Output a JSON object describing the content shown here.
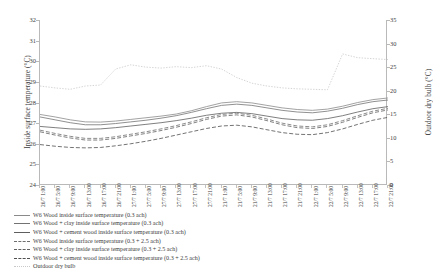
{
  "chart_data": {
    "type": "line",
    "title": "",
    "xlabel": "",
    "ylabel": "Inside surface temperature (°C)",
    "y2label": "Outdoor dry bulb (°C)",
    "ylim": [
      24,
      32
    ],
    "yticks": [
      "24",
      "25",
      "26",
      "27",
      "28",
      "29",
      "30",
      "31",
      "32"
    ],
    "y2lim": [
      0,
      35
    ],
    "y2ticks": [
      "0",
      "5",
      "10",
      "15",
      "20",
      "25",
      "30",
      "35"
    ],
    "grid": false,
    "legend_position": "below",
    "x": [
      "26/7 1:00",
      "26/7 5:00",
      "26/7 9:00",
      "26/7 13:00",
      "26/7 17:00",
      "26/7 21:00",
      "27/7 1:00",
      "27/7 5:00",
      "27/7 9:00",
      "27/7 13:00",
      "27/7 17:00",
      "27/7 21:00",
      "21/7 1:00",
      "21/7 5:00",
      "21/7 9:00",
      "21/7 13:00",
      "21/7 17:00",
      "21/7 21:00",
      "22/7 1:00",
      "22/7 5:00",
      "22/7 9:00",
      "22/7 13:00",
      "22/7 17:00",
      "22/7 21:00"
    ],
    "xtick_labels": [
      "26/7 1:00",
      "26/7 5:00",
      "26/7 9:00",
      "26/7 13:00",
      "26/7 17:00",
      "26/7 21:00",
      "27/7 1:00",
      "27/7 5:00",
      "27/7 9:00",
      "27/7 13:00",
      "27/7 17:00",
      "27/7 21:00",
      "21/7 1:00",
      "21/7 5:00",
      "21/7 9:00",
      "21/7 13:00",
      "21/7 17:00",
      "21/7 21:00",
      "22/7 1:00",
      "22/7 5:00",
      "22/7 9:00",
      "22/7 13:00",
      "22/7 17:00",
      "22/7 21:00"
    ],
    "series": [
      {
        "name": "W6 Wood inside surface temperature (0.3 ach)",
        "axis": "left",
        "style": "solid",
        "color": "#8a8a8a",
        "values": [
          27.42,
          27.3,
          27.16,
          27.06,
          27.05,
          27.1,
          27.18,
          27.26,
          27.34,
          27.44,
          27.6,
          27.8,
          27.98,
          28.04,
          27.98,
          27.86,
          27.74,
          27.66,
          27.62,
          27.68,
          27.82,
          28.0,
          28.14,
          28.22
        ]
      },
      {
        "name": "W6 Wood + clay inside surface temperature (0.3 ach)",
        "axis": "left",
        "style": "solid",
        "color": "#737373",
        "values": [
          27.3,
          27.16,
          27.02,
          26.92,
          26.92,
          26.98,
          27.06,
          27.14,
          27.24,
          27.36,
          27.52,
          27.7,
          27.86,
          27.92,
          27.86,
          27.74,
          27.62,
          27.54,
          27.5,
          27.58,
          27.72,
          27.9,
          28.04,
          28.12
        ]
      },
      {
        "name": "W6 Wood + cement wood inside surface temperature (0.3 ach)",
        "axis": "left",
        "style": "solid",
        "color": "#5e5e5e",
        "values": [
          26.84,
          26.78,
          26.72,
          26.7,
          26.72,
          26.78,
          26.86,
          26.94,
          27.02,
          27.12,
          27.24,
          27.38,
          27.48,
          27.52,
          27.46,
          27.34,
          27.22,
          27.16,
          27.14,
          27.22,
          27.36,
          27.54,
          27.7,
          27.8
        ]
      },
      {
        "name": "W6 Wood inside surface temperature (0.3 + 2.5 ach)",
        "axis": "left",
        "style": "dashed",
        "color": "#6e6e6e",
        "values": [
          26.66,
          26.5,
          26.36,
          26.26,
          26.26,
          26.34,
          26.46,
          26.58,
          26.72,
          26.88,
          27.06,
          27.26,
          27.42,
          27.48,
          27.38,
          27.2,
          27.0,
          26.86,
          26.82,
          26.92,
          27.12,
          27.36,
          27.58,
          27.72
        ]
      },
      {
        "name": "W6 Wood + clay inside surface temperature (0.3 + 2.5 ach)",
        "axis": "left",
        "style": "dashed",
        "color": "#606060",
        "values": [
          26.58,
          26.42,
          26.28,
          26.18,
          26.18,
          26.26,
          26.38,
          26.5,
          26.64,
          26.8,
          26.98,
          27.18,
          27.34,
          27.4,
          27.3,
          27.12,
          26.92,
          26.78,
          26.74,
          26.84,
          27.04,
          27.28,
          27.5,
          27.64
        ]
      },
      {
        "name": "W6 Wood + cement wood inside surface temperature (0.3 + 2.5 ach)",
        "axis": "left",
        "style": "dashed",
        "color": "#4f4f4f",
        "values": [
          25.96,
          25.88,
          25.82,
          25.8,
          25.82,
          25.9,
          26.0,
          26.12,
          26.26,
          26.42,
          26.58,
          26.74,
          26.86,
          26.9,
          26.82,
          26.68,
          26.54,
          26.46,
          26.44,
          26.54,
          26.72,
          26.94,
          27.14,
          27.28
        ]
      },
      {
        "name": "Outdoor dry bulb",
        "axis": "right",
        "style": "dotted",
        "color": "#c9c9c9",
        "values": [
          21.0,
          20.6,
          20.3,
          21.0,
          21.2,
          24.6,
          25.5,
          25.0,
          24.8,
          25.1,
          24.9,
          25.3,
          24.6,
          22.8,
          21.6,
          21.0,
          20.6,
          20.4,
          20.3,
          20.2,
          27.8,
          27.0,
          26.8,
          26.6
        ]
      }
    ]
  },
  "legend": {
    "items": [
      {
        "label": "W6 Wood inside surface temperature (0.3 ach)"
      },
      {
        "label": "W6 Wood + clay inside surface temperature (0.3 ach)"
      },
      {
        "label": "W6 Wood + cement wood inside surface temperature (0.3 ach)"
      },
      {
        "label": "W6 Wood inside surface temperature (0.3 + 2.5 ach)"
      },
      {
        "label": "W6 Wood + clay inside surface temperature (0.3 + 2.5 ach)"
      },
      {
        "label": "W6 Wood + cement wood inside surface temperature (0.3 + 2.5 ach)"
      },
      {
        "label": "Outdoor dry bulb"
      }
    ]
  }
}
